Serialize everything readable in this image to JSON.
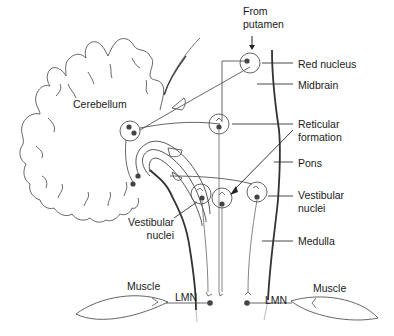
{
  "figure": {
    "title_cut": "",
    "labels": {
      "from_putamen": [
        "From",
        "putamen"
      ],
      "red_nucleus": "Red nucleus",
      "midbrain": "Midbrain",
      "cerebellum": "Cerebellum",
      "reticular_formation": [
        "Reticular",
        "formation"
      ],
      "pons": "Pons",
      "vestibular_nuclei_right": [
        "Vestibular",
        "nuclei"
      ],
      "vestibular_nuclei_left": [
        "Vestibular",
        "nuclei"
      ],
      "medulla": "Medulla",
      "muscle_left": "Muscle",
      "muscle_right": "Muscle",
      "lmn_left": "LMN",
      "lmn_right": "LMN"
    },
    "colors": {
      "line": "#333333",
      "thin_line": "#777777",
      "dot": "#444444",
      "background": "#ffffff"
    }
  }
}
